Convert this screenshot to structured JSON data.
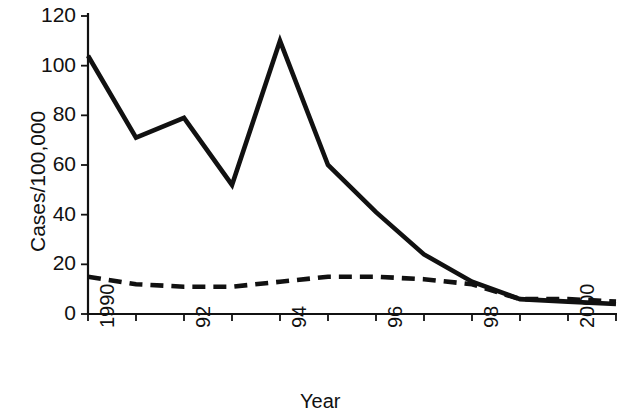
{
  "chart_data": {
    "type": "line",
    "title": "",
    "subtitle": "",
    "xlabel": "Year",
    "ylabel": "Cases/100,000",
    "x": [
      1990,
      1991,
      1992,
      1993,
      1994,
      1995,
      1996,
      1997,
      1998,
      1999,
      2000,
      2001
    ],
    "xlim": [
      1990,
      2001
    ],
    "ylim": [
      0,
      120
    ],
    "yticks": [
      0,
      20,
      40,
      60,
      80,
      100,
      120
    ],
    "ytick_labels": [
      "0",
      "20",
      "40",
      "60",
      "80",
      "100",
      "120"
    ],
    "xticks": [
      1990,
      1991,
      1992,
      1993,
      1994,
      1995,
      1996,
      1997,
      1998,
      1999,
      2000,
      2001
    ],
    "xtick_labels": [
      "1990",
      "",
      "92",
      "",
      "94",
      "",
      "96",
      "",
      "98",
      "",
      "2000",
      ""
    ],
    "grid": false,
    "legend": false,
    "legend_position": "none",
    "series": [
      {
        "name": "solid-series",
        "style": "solid",
        "color": "#111111",
        "values": [
          104,
          71,
          79,
          52,
          110,
          60,
          41,
          24,
          13,
          6,
          5,
          4
        ]
      },
      {
        "name": "dashed-series",
        "style": "dashed",
        "color": "#111111",
        "values": [
          15,
          12,
          11,
          11,
          13,
          15,
          15,
          14,
          12,
          6,
          6,
          5
        ]
      }
    ]
  },
  "axes": {
    "y_axis_title": "Cases/100,000",
    "x_axis_title": "Year"
  }
}
